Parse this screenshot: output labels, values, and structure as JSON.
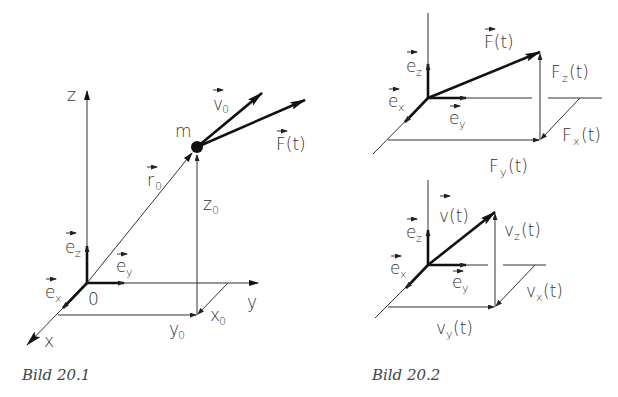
{
  "figures": [
    {
      "caption": "Bild 20.1",
      "labels": {
        "z_axis": "z",
        "y_axis": "y",
        "x_axis": "x",
        "origin": "0",
        "mass": "m",
        "r0": "r",
        "r0_sub": "0",
        "v0": "v",
        "v0_sub": "0",
        "force": "F(t)",
        "ez": "e",
        "ez_sub": "z",
        "ey": "e",
        "ey_sub": "y",
        "ex": "e",
        "ex_sub": "x",
        "z0": "z",
        "z0_sub": "0",
        "y0": "y",
        "y0_sub": "0",
        "x0": "x",
        "x0_sub": "0"
      }
    },
    {
      "caption": "Bild 20.2",
      "top": {
        "vector": "F(t)",
        "z_comp": "F",
        "z_comp_sub": "z",
        "x_comp": "F",
        "x_comp_sub": "x",
        "y_comp": "F",
        "y_comp_sub": "y",
        "arg": "(t)",
        "ez": "e",
        "ez_sub": "z",
        "ey": "e",
        "ey_sub": "y",
        "ex": "e",
        "ex_sub": "x"
      },
      "bottom": {
        "vector": "v(t)",
        "z_comp": "v",
        "z_comp_sub": "z",
        "x_comp": "v",
        "x_comp_sub": "x",
        "y_comp": "v",
        "y_comp_sub": "y",
        "arg": "(t)",
        "ez": "e",
        "ez_sub": "z",
        "ey": "e",
        "ey_sub": "y",
        "ex": "e",
        "ex_sub": "x"
      }
    }
  ]
}
